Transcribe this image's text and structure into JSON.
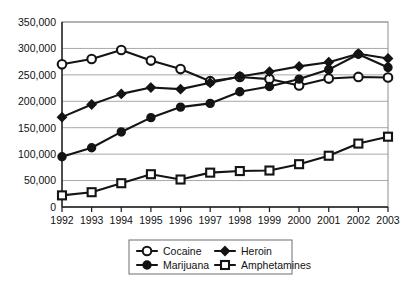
{
  "chart_data": {
    "type": "line",
    "title": "",
    "xlabel": "",
    "ylabel": "",
    "categories": [
      "1992",
      "1993",
      "1994",
      "1995",
      "1996",
      "1997",
      "1998",
      "1999",
      "2000",
      "2001",
      "2002",
      "2003"
    ],
    "x": [
      1992,
      1993,
      1994,
      1995,
      1996,
      1997,
      1998,
      1999,
      2000,
      2001,
      2002,
      2003
    ],
    "ylim": [
      0,
      350000
    ],
    "xlim": [
      1992,
      2003
    ],
    "y_ticks": [
      0,
      50000,
      100000,
      150000,
      200000,
      250000,
      300000,
      350000
    ],
    "y_tick_labels": [
      "0",
      "50,000",
      "100,000",
      "150,000",
      "200,000",
      "250,000",
      "300,000",
      "350,000"
    ],
    "grid": true,
    "grid_axis": "y",
    "legend_position": "bottom",
    "series": [
      {
        "name": "Cocaine",
        "marker": "open-circle",
        "values": [
          270000,
          280000,
          297000,
          277000,
          261000,
          238000,
          246000,
          242000,
          230000,
          243000,
          246000,
          245000
        ]
      },
      {
        "name": "Heroin",
        "marker": "solid-diamond",
        "values": [
          170000,
          194000,
          214000,
          226000,
          223000,
          235000,
          247000,
          256000,
          266000,
          274000,
          290000,
          281000
        ]
      },
      {
        "name": "Marijuana",
        "marker": "solid-circle",
        "values": [
          95000,
          112000,
          142000,
          169000,
          189000,
          196000,
          218000,
          228000,
          242000,
          260000,
          289000,
          264000
        ]
      },
      {
        "name": "Amphetamines",
        "marker": "open-square",
        "values": [
          22000,
          28000,
          45000,
          62000,
          52000,
          65000,
          68000,
          69000,
          81000,
          97000,
          120000,
          133000
        ]
      }
    ]
  },
  "legend": {
    "entries": [
      {
        "label": "Cocaine",
        "marker": "open-circle"
      },
      {
        "label": "Heroin",
        "marker": "solid-diamond"
      },
      {
        "label": "Marijuana",
        "marker": "solid-circle"
      },
      {
        "label": "Amphetamines",
        "marker": "open-square"
      }
    ]
  },
  "colors": {
    "series": "#141414",
    "gridline": "#a8a8a8",
    "frame": "#8f8f8f",
    "axis": "#1a1a1a",
    "background": "#ffffff"
  }
}
